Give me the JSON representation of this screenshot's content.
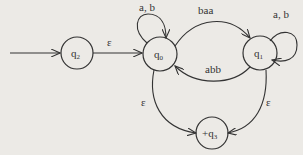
{
  "diagram": {
    "type": "finite-automaton",
    "states": [
      {
        "id": "q2",
        "label": "q",
        "sub": "2",
        "initial": true,
        "final": false
      },
      {
        "id": "q0",
        "label": "q",
        "sub": "0",
        "initial": false,
        "final": false
      },
      {
        "id": "q1",
        "label": "q",
        "sub": "1",
        "initial": false,
        "final": false
      },
      {
        "id": "q3",
        "label": "+q",
        "sub": "3",
        "initial": false,
        "final": true
      }
    ],
    "transitions": [
      {
        "from": "q2",
        "to": "q0",
        "label": "ε"
      },
      {
        "from": "q0",
        "to": "q0",
        "label": "a, b"
      },
      {
        "from": "q0",
        "to": "q1",
        "label": "baa"
      },
      {
        "from": "q1",
        "to": "q0",
        "label": "abb"
      },
      {
        "from": "q1",
        "to": "q1",
        "label": "a, b"
      },
      {
        "from": "q0",
        "to": "q3",
        "label": "ε"
      },
      {
        "from": "q1",
        "to": "q3",
        "label": "ε"
      }
    ]
  }
}
